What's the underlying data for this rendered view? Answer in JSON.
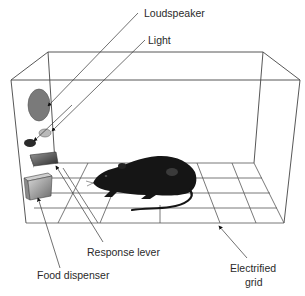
{
  "diagram": {
    "labels": {
      "loudspeaker": "Loudspeaker",
      "light": "Light",
      "response_lever": "Response lever",
      "food_dispenser": "Food dispenser",
      "electrified_grid_line1": "Electrified",
      "electrified_grid_line2": "grid"
    },
    "components": [
      "loudspeaker",
      "light",
      "response-lever",
      "food-dispenser",
      "electrified-grid",
      "rat",
      "chamber"
    ],
    "colors": {
      "loudspeaker": "#7a7a7a",
      "light": "#b9b9b9",
      "light_bulb_dark": "#2a2a2a",
      "rat": "#151515",
      "lines": "#444444",
      "background": "#ffffff"
    }
  }
}
